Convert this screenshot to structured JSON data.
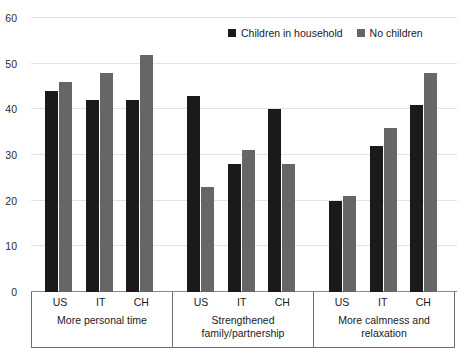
{
  "chart_data": {
    "type": "bar",
    "title": "",
    "subtitle": "",
    "xlabel": "",
    "ylabel": "",
    "ylim": [
      0,
      60
    ],
    "yticks": [
      0,
      10,
      20,
      30,
      40,
      50,
      60
    ],
    "grid": true,
    "legend_position": "top-right",
    "categories": [
      "US",
      "IT",
      "CH",
      "US",
      "IT",
      "CH",
      "US",
      "IT",
      "CH"
    ],
    "groups": [
      {
        "label": "More personal time",
        "categories": [
          "US",
          "IT",
          "CH"
        ],
        "series": [
          {
            "name": "Children in household",
            "values": [
              44,
              42,
              42
            ]
          },
          {
            "name": "No children",
            "values": [
              46,
              48,
              52
            ]
          }
        ]
      },
      {
        "label": "Strengthened\nfamily/partnership",
        "categories": [
          "US",
          "IT",
          "CH"
        ],
        "series": [
          {
            "name": "Children in household",
            "values": [
              43,
              28,
              40
            ]
          },
          {
            "name": "No children",
            "values": [
              23,
              31,
              28
            ]
          }
        ]
      },
      {
        "label": "More calmness and\nrelaxation",
        "categories": [
          "US",
          "IT",
          "CH"
        ],
        "series": [
          {
            "name": "Children in household",
            "values": [
              20,
              32,
              41
            ]
          },
          {
            "name": "No children",
            "values": [
              21,
              36,
              48
            ]
          }
        ]
      }
    ],
    "series": [
      {
        "name": "Children in household",
        "color": "#1a1a1a",
        "values": [
          44,
          42,
          42,
          43,
          28,
          40,
          20,
          32,
          41
        ]
      },
      {
        "name": "No children",
        "color": "#666666",
        "values": [
          46,
          48,
          52,
          23,
          31,
          28,
          21,
          36,
          48
        ]
      }
    ]
  },
  "legend": {
    "entries": [
      {
        "label": "Children in household",
        "color": "#1a1a1a",
        "swatch_name": "legend-swatch-children-in-household"
      },
      {
        "label": "No children",
        "color": "#666666",
        "swatch_name": "legend-swatch-no-children"
      }
    ]
  },
  "colors": {
    "series_0": "#1a1a1a",
    "series_1": "#666666",
    "gridline": "#e2e2e2",
    "axis": "#6f6f6f",
    "background": "#ffffff",
    "text": "#1a1a1a"
  }
}
